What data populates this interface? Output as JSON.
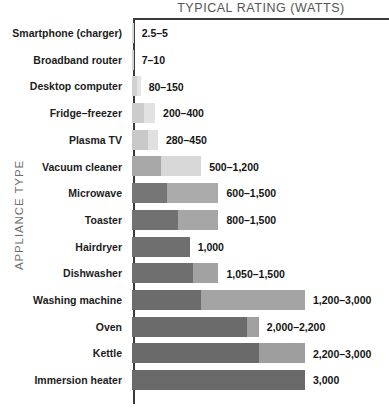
{
  "chart": {
    "title": "TYPICAL RATING (WATTS)",
    "y_axis_title": "APPLIANCE TYPE"
  },
  "chart_data": {
    "type": "bar",
    "title": "TYPICAL RATING (WATTS)",
    "xlabel": "TYPICAL RATING (WATTS)",
    "ylabel": "APPLIANCE TYPE",
    "orientation": "horizontal",
    "grid": false,
    "legend": false,
    "xlim": [
      0,
      3000
    ],
    "categories": [
      "Smartphone (charger)",
      "Broadband router",
      "Desktop computer",
      "Fridge–freezer",
      "Plasma TV",
      "Vacuum cleaner",
      "Microwave",
      "Toaster",
      "Hairdryer",
      "Dishwasher",
      "Washing machine",
      "Oven",
      "Kettle",
      "Immersion heater"
    ],
    "series": [
      {
        "name": "minimum watts",
        "values": [
          2.5,
          7,
          80,
          200,
          280,
          500,
          600,
          800,
          1000,
          1050,
          1200,
          2000,
          2200,
          3000
        ]
      },
      {
        "name": "maximum watts",
        "values": [
          5,
          10,
          150,
          400,
          450,
          1200,
          1500,
          1500,
          1000,
          1500,
          3000,
          2200,
          3000,
          3000
        ]
      }
    ],
    "rows": [
      {
        "label": "Smartphone (charger)",
        "min": 2.5,
        "max": 5,
        "value_label": "2.5–5",
        "dark": "#d9d9d9",
        "light": "#ececec"
      },
      {
        "label": "Broadband router",
        "min": 7,
        "max": 10,
        "value_label": "7–10",
        "dark": "#d4d4d4",
        "light": "#e8e8e8"
      },
      {
        "label": "Desktop computer",
        "min": 80,
        "max": 150,
        "value_label": "80–150",
        "dark": "#d0d0d0",
        "light": "#e4e4e4"
      },
      {
        "label": "Fridge–freezer",
        "min": 200,
        "max": 400,
        "value_label": "200–400",
        "dark": "#cccccc",
        "light": "#e2e2e2"
      },
      {
        "label": "Plasma TV",
        "min": 280,
        "max": 450,
        "value_label": "280–450",
        "dark": "#c9c9c9",
        "light": "#e0e0e0"
      },
      {
        "label": "Vacuum cleaner",
        "min": 500,
        "max": 1200,
        "value_label": "500–1,200",
        "dark": "#a8a8a8",
        "light": "#d8d8d8"
      },
      {
        "label": "Microwave",
        "min": 600,
        "max": 1500,
        "value_label": "600–1,500",
        "dark": "#767676",
        "light": "#ababab"
      },
      {
        "label": "Toaster",
        "min": 800,
        "max": 1500,
        "value_label": "800–1,500",
        "dark": "#717171",
        "light": "#a6a6a6"
      },
      {
        "label": "Hairdryer",
        "min": 1000,
        "max": 1000,
        "value_label": "1,000",
        "dark": "#6f6f6f",
        "light": "#6f6f6f"
      },
      {
        "label": "Dishwasher",
        "min": 1050,
        "max": 1500,
        "value_label": "1,050–1,500",
        "dark": "#6e6e6e",
        "light": "#a2a2a2"
      },
      {
        "label": "Washing machine",
        "min": 1200,
        "max": 3000,
        "value_label": "1,200–3,000",
        "dark": "#6c6c6c",
        "light": "#a4a4a4"
      },
      {
        "label": "Oven",
        "min": 2000,
        "max": 2200,
        "value_label": "2,000–2,200",
        "dark": "#6b6b6b",
        "light": "#a0a0a0"
      },
      {
        "label": "Kettle",
        "min": 2200,
        "max": 3000,
        "value_label": "2,200–3,000",
        "dark": "#6a6a6a",
        "light": "#9e9e9e"
      },
      {
        "label": "Immersion heater",
        "min": 3000,
        "max": 3000,
        "value_label": "3,000",
        "dark": "#696969",
        "light": "#696969"
      }
    ]
  }
}
